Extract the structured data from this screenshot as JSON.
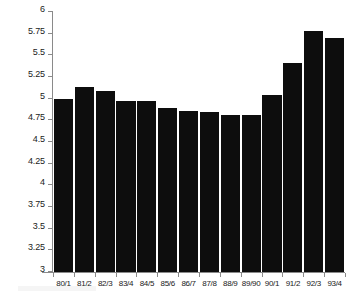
{
  "chart_data": {
    "type": "bar",
    "title": "",
    "subtitle": "",
    "xlabel": "",
    "ylabel": "",
    "categories": [
      "80/1",
      "81/2",
      "82/3",
      "83/4",
      "84/5",
      "85/6",
      "86/7",
      "87/8",
      "88/9",
      "89/90",
      "90/1",
      "91/2",
      "92/3",
      "93/4"
    ],
    "values": [
      5.0,
      5.13,
      5.09,
      4.97,
      4.97,
      4.89,
      4.86,
      4.85,
      4.81,
      4.81,
      5.04,
      5.41,
      5.78,
      5.7
    ],
    "series": [
      {
        "name": "",
        "values": [
          5.0,
          5.13,
          5.09,
          4.97,
          4.97,
          4.89,
          4.86,
          4.85,
          4.81,
          4.81,
          5.04,
          5.41,
          5.78,
          5.7
        ]
      }
    ],
    "ylim": [
      3,
      6
    ],
    "xlim": [
      0,
      14
    ],
    "ytick_values": [
      3,
      3.25,
      3.5,
      3.75,
      4,
      4.25,
      4.5,
      4.75,
      5,
      5.25,
      5.5,
      5.75,
      6
    ],
    "ytick_labels": [
      "3",
      "3.25",
      "3.5",
      "3.75",
      "4",
      "4.25",
      "4.5",
      "4.75",
      "5",
      "5.25",
      "5.5",
      "5.75",
      "6"
    ],
    "grid": false,
    "legend": null,
    "legend_position": "none",
    "bar_color": "#0d0d0d",
    "axis_color": "#8a8a8a",
    "background_color": "#ffffff"
  }
}
